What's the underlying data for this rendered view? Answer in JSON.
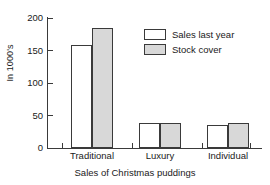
{
  "chart_data": {
    "type": "bar",
    "title": "",
    "subtitle": "",
    "xlabel": "Sales of Christmas puddings",
    "ylabel": "In 1000's",
    "categories": [
      "Traditional",
      "Luxury",
      "Individual"
    ],
    "series": [
      {
        "name": "Sales last year",
        "values": [
          158,
          38,
          35
        ],
        "color": "#ffffff"
      },
      {
        "name": "Stock cover",
        "values": [
          185,
          38,
          38
        ],
        "color": "#d8d8d8"
      }
    ],
    "ylim": [
      0,
      200
    ],
    "yticks": [
      0,
      50,
      100,
      150,
      200
    ],
    "ytick_labels": [
      "0",
      "50",
      "100",
      "150",
      "200"
    ],
    "grid": false,
    "legend_position": "upper-right",
    "outline_color": "#3a3a3a"
  },
  "axis": {
    "y_title": "In 1000's",
    "x_title": "Sales of Christmas puddings",
    "ticks": [
      {
        "label": "200"
      },
      {
        "label": "150"
      },
      {
        "label": "100"
      },
      {
        "label": "50"
      },
      {
        "label": "0"
      }
    ]
  },
  "categories": [
    {
      "label": "Traditional"
    },
    {
      "label": "Luxury"
    },
    {
      "label": "Individual"
    }
  ],
  "legend": {
    "items": [
      {
        "label": "Sales last year"
      },
      {
        "label": "Stock cover"
      }
    ]
  }
}
